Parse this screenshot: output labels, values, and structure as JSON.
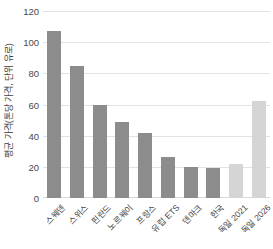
{
  "chart_data": {
    "type": "bar",
    "title": "",
    "xlabel": "",
    "ylabel": "평균 가격(톤당 가격, 단위 유로)",
    "ylim": [
      0,
      120
    ],
    "yticks": [
      0,
      20,
      40,
      60,
      80,
      100,
      120
    ],
    "grid": true,
    "legend": "none",
    "categories": [
      "스웨덴",
      "스위스",
      "핀란드",
      "노르웨이",
      "프랑스",
      "유럽 ETS",
      "덴마크",
      "한국",
      "독일 2021",
      "독일 2026"
    ],
    "values": [
      107,
      85,
      60,
      49,
      42,
      26,
      20,
      19,
      22,
      62
    ],
    "bar_colors": [
      "#8c8c8c",
      "#8c8c8c",
      "#8c8c8c",
      "#8c8c8c",
      "#8c8c8c",
      "#8c8c8c",
      "#8c8c8c",
      "#8c8c8c",
      "#d5d5d5",
      "#d5d5d5"
    ]
  },
  "axis": {
    "grid_color": "#e2e2e2",
    "tick_text_color": "#4a4a4a",
    "label_text_color": "#3f3f3f"
  }
}
